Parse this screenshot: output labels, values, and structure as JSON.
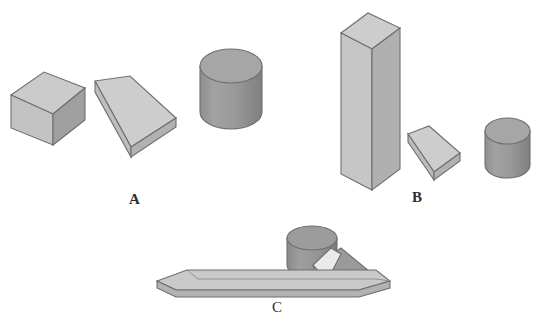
{
  "figure": {
    "title": "",
    "background_color": "#ffffff",
    "width": 548,
    "height": 329
  },
  "palette": {
    "light_face": "#cfcfcf",
    "mid_face": "#b6b6b6",
    "dark_face": "#9a9a9a",
    "cylinder_light": "#9d9d9d",
    "cylinder_dark": "#8a8a8a",
    "cylinder_top": "#a8a8a8",
    "white_face": "#efefef",
    "outline": "#6d6d6d",
    "label_color": "#2e2e2e"
  },
  "groups": [
    {
      "id": "group-a",
      "label": "A",
      "label_x": 129,
      "label_y": 192,
      "objects": [
        {
          "name": "cube",
          "shape": "cube",
          "x": 10,
          "y": 72,
          "w": 75,
          "h": 73
        },
        {
          "name": "wedge",
          "shape": "wedge",
          "x": 90,
          "y": 76,
          "w": 86,
          "h": 81
        },
        {
          "name": "cylinder",
          "shape": "cylinder",
          "x": 200,
          "y": 48,
          "w": 62,
          "h": 82
        }
      ]
    },
    {
      "id": "group-b",
      "label": "B",
      "label_x": 412,
      "label_y": 190,
      "objects": [
        {
          "name": "tall-prism",
          "shape": "tall-prism",
          "x": 340,
          "y": 13,
          "w": 60,
          "h": 177
        },
        {
          "name": "small-wedge",
          "shape": "wedge",
          "x": 405,
          "y": 125,
          "w": 55,
          "h": 55
        },
        {
          "name": "small-cylinder",
          "shape": "cylinder",
          "x": 485,
          "y": 118,
          "w": 45,
          "h": 60
        }
      ]
    },
    {
      "id": "group-c",
      "label": "C",
      "label_x": 272,
      "label_y": 300,
      "objects": [
        {
          "name": "flat-slab",
          "shape": "flat-slab",
          "x": 156,
          "y": 268,
          "w": 234,
          "h": 28
        },
        {
          "name": "cylinder",
          "shape": "cylinder",
          "x": 287,
          "y": 228,
          "w": 50,
          "h": 50
        },
        {
          "name": "triangular-wedge",
          "shape": "triangular-wedge",
          "x": 313,
          "y": 247,
          "w": 73,
          "h": 40
        }
      ]
    }
  ],
  "labels": {
    "a": "A",
    "b": "B",
    "c": "C"
  }
}
